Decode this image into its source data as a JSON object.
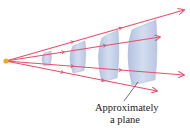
{
  "diagram": {
    "type": "spherical-wavefronts-to-plane",
    "colors": {
      "ray": "#e5506a",
      "wavefront_fill": "#c2cfe6",
      "wavefront_edge": "#9fb2d4",
      "source": "#f5a623",
      "leader": "#333333"
    },
    "source": {
      "x": 6,
      "y": 61
    },
    "rays": [
      {
        "name": "ray-top",
        "end": [
          184,
          10
        ]
      },
      {
        "name": "ray-upper",
        "end": [
          160,
          37
        ]
      },
      {
        "name": "ray-lower",
        "end": [
          184,
          75
        ]
      },
      {
        "name": "ray-bottom",
        "end": [
          157,
          91
        ]
      }
    ],
    "wavefronts": [
      {
        "name": "wavefront-1",
        "x": 44,
        "top": 51,
        "bottom": 66,
        "width": 7,
        "curve": 4
      },
      {
        "name": "wavefront-2",
        "x": 73,
        "top": 41,
        "bottom": 73,
        "width": 12,
        "curve": 6
      },
      {
        "name": "wavefront-3",
        "x": 102,
        "top": 30,
        "bottom": 82,
        "width": 16,
        "curve": 7
      },
      {
        "name": "wavefront-4",
        "x": 132,
        "top": 20,
        "bottom": 85,
        "width": 24,
        "curve": 8
      }
    ],
    "annotation": {
      "line1": "Approximately",
      "line2": "a plane",
      "leader_from": [
        124,
        101
      ],
      "leader_to": [
        138,
        82
      ]
    }
  }
}
